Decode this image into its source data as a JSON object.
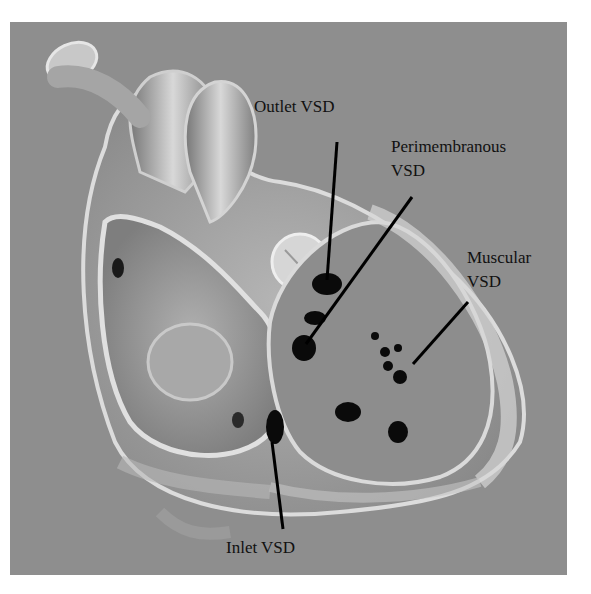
{
  "figure": {
    "background_color": "#8e8e8e",
    "labels": {
      "outlet": "Outlet VSD",
      "perimembranous_line1": "Perimembranous",
      "perimembranous_line2": "VSD",
      "muscular_line1": "Muscular",
      "muscular_line2": "VSD",
      "inlet": "Inlet VSD"
    }
  }
}
